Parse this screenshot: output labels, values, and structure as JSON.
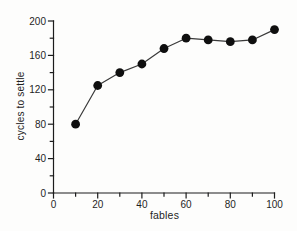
{
  "chart_data": {
    "type": "line",
    "title": "",
    "xlabel": "fables",
    "ylabel": "cycles to settle",
    "x": [
      10,
      20,
      30,
      40,
      50,
      60,
      70,
      80,
      90,
      100
    ],
    "y": [
      80,
      125,
      140,
      150,
      168,
      180,
      178,
      176,
      178,
      190
    ],
    "series": [
      {
        "name": "cycles to settle",
        "values": [
          80,
          125,
          140,
          150,
          168,
          180,
          178,
          176,
          178,
          190
        ]
      }
    ],
    "xlim": [
      0,
      100
    ],
    "ylim": [
      0,
      200
    ],
    "x_major_ticks": [
      0,
      20,
      40,
      60,
      80,
      100
    ],
    "x_minor_ticks": [
      10,
      30,
      50,
      70,
      90
    ],
    "y_major_ticks": [
      0,
      40,
      80,
      120,
      160,
      200
    ],
    "y_minor_ticks": [
      20,
      60,
      100,
      140,
      180
    ],
    "grid": false,
    "legend": false,
    "marker": "filled-circle",
    "colors": {
      "axis": "#1c1c1c",
      "line": "#3a3a3a",
      "marker": "#0f0f0f",
      "text": "#1f1f1f",
      "background": "#fdfdfc"
    }
  }
}
